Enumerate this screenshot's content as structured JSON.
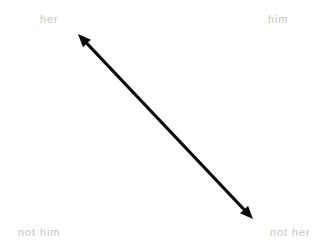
{
  "canvas": {
    "width": 323,
    "height": 252,
    "background_color": "#ffffff"
  },
  "diagram": {
    "type": "double-headed-arrow-axis",
    "label_color": "#c6c6c6",
    "arrow_color": "#0a0a0a",
    "quadrant_labels": {
      "top_left": "her",
      "top_right": "him",
      "bottom_left": "not him",
      "bottom_right": "not her"
    },
    "arrow": {
      "name": "diagonal-double-arrow",
      "start_x": 78,
      "start_y": 34,
      "end_x": 253,
      "end_y": 219,
      "stroke_width": 3,
      "head_length": 13,
      "head_width": 11,
      "double_headed": true
    }
  }
}
